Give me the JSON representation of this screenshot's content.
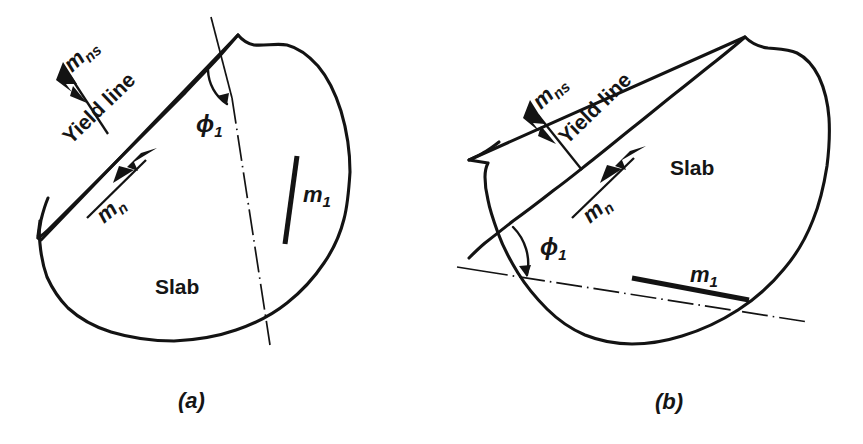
{
  "figure": {
    "background_color": "#ffffff",
    "ink_color": "#131313",
    "caption_a": "(a)",
    "caption_b": "(b)"
  },
  "panels": [
    {
      "id": "a",
      "caption": "(a)",
      "labels": {
        "m_ns_main": "m",
        "m_ns_sub": "ns",
        "m_n_main": "m",
        "m_n_sub": "n",
        "yield_line": "Yield line",
        "slab": "Slab",
        "phi_main": "ϕ",
        "phi_sub": "1",
        "m1_main": "m",
        "m1_sub": "1"
      },
      "annotations": {
        "reinforcement_orientation": "near-vertical",
        "centerline_orientation": "near-vertical",
        "angle_symbol": "ϕ1",
        "moment_vector_style": "double-arrowhead"
      }
    },
    {
      "id": "b",
      "caption": "(b)",
      "labels": {
        "m_ns_main": "m",
        "m_ns_sub": "ns",
        "m_n_main": "m",
        "m_n_sub": "n",
        "yield_line": "Yield line",
        "slab": "Slab",
        "phi_main": "ϕ",
        "phi_sub": "1",
        "m1_main": "m",
        "m1_sub": "1"
      },
      "annotations": {
        "reinforcement_orientation": "shallow-diagonal",
        "centerline_orientation": "shallow-diagonal",
        "angle_symbol": "ϕ1",
        "moment_vector_style": "double-arrowhead"
      }
    }
  ]
}
